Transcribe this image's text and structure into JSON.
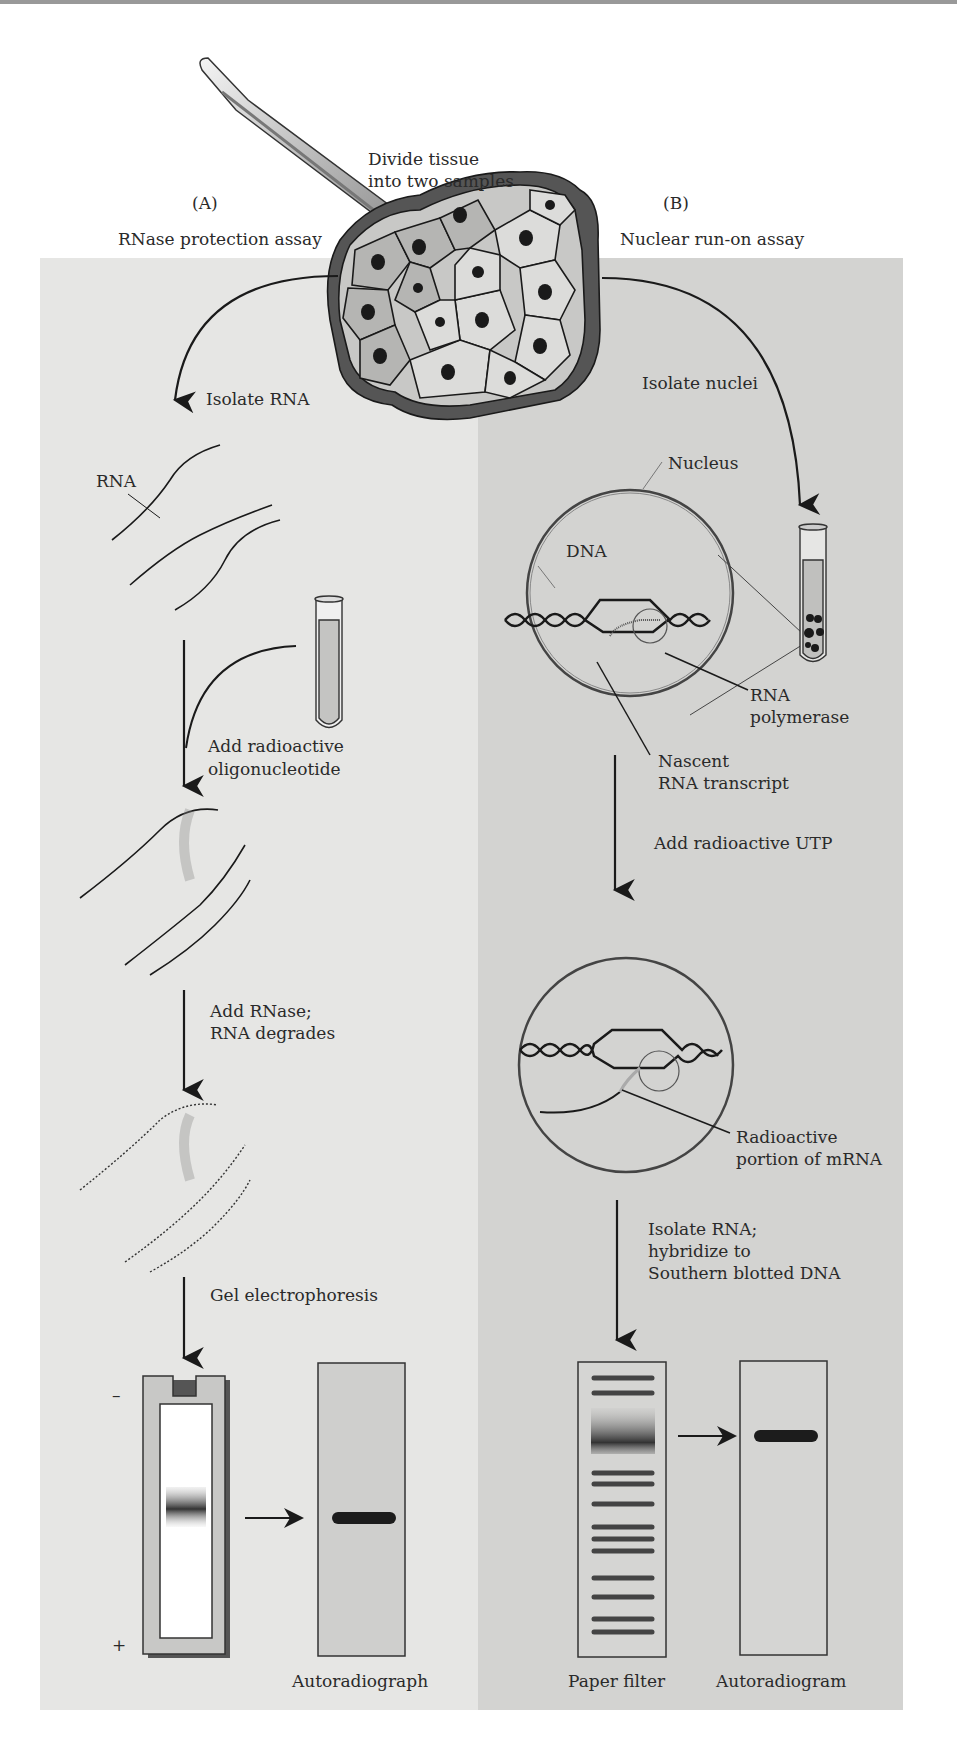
{
  "diagram": {
    "title_lines": [
      "Divide tissue",
      "into two samples"
    ],
    "colors": {
      "panel_a_bg": "#e6e6e4",
      "panel_b_bg": "#d3d3d1",
      "cell_light": "#d8d8d6",
      "cell_mid": "#b5b5b3",
      "cell_dark": "#555555",
      "nucleus": "#1a1a1a",
      "line": "#1a1a1a",
      "gel_frame": "#c8c8c6",
      "band": "#1c1c1c"
    },
    "panel_a": {
      "letter": "(A)",
      "name": "RNase protection assay",
      "steps": [
        {
          "label": "Isolate RNA"
        },
        {
          "label_lines": [
            "Add radioactive",
            "oligonucleotide"
          ]
        },
        {
          "label_lines": [
            "Add RNase;",
            "RNA degrades"
          ]
        },
        {
          "label": "Gel electrophoresis"
        }
      ],
      "rna_label": "RNA",
      "gel": {
        "minus": "–",
        "plus": "+"
      },
      "result_label": "Autoradiograph"
    },
    "panel_b": {
      "letter": "(B)",
      "name": "Nuclear run-on assay",
      "steps": [
        {
          "label": "Isolate nuclei"
        },
        {
          "label": "Add radioactive UTP"
        },
        {
          "label_lines": [
            "Isolate RNA;",
            "hybridize to",
            "Southern blotted DNA"
          ]
        }
      ],
      "nucleus_label": "Nucleus",
      "dna_label": "DNA",
      "polymerase_label_lines": [
        "RNA",
        "polymerase"
      ],
      "transcript_label_lines": [
        "Nascent",
        "RNA transcript"
      ],
      "radioactive_label_lines": [
        "Radioactive",
        "portion of mRNA"
      ],
      "filter_label": "Paper filter",
      "result_label": "Autoradiogram",
      "filter_bands_y": [
        1378,
        1393,
        1473,
        1484,
        1504,
        1527,
        1539,
        1551,
        1578,
        1597,
        1619,
        1632
      ],
      "filter_smear_y": [
        1410,
        1452
      ]
    }
  }
}
